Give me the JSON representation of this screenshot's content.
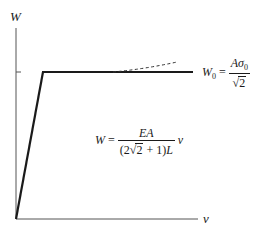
{
  "diagram": {
    "type": "load-displacement curve",
    "axes": {
      "y_label": "W",
      "x_label": "v"
    },
    "curve": {
      "segments": [
        {
          "name": "linear-elastic",
          "from": [
            16,
            219
          ],
          "to": [
            43,
            72
          ],
          "style": "solid-thick"
        },
        {
          "name": "plastic-plateau",
          "from": [
            43,
            72
          ],
          "to": [
            193,
            72
          ],
          "style": "solid-thick"
        },
        {
          "name": "hardening-trend",
          "from": [
            113,
            72
          ],
          "to": [
            177,
            62
          ],
          "style": "dashed"
        }
      ],
      "color": "#1a1a1a"
    },
    "plateau_label": {
      "lhs": "W",
      "lhs_sub": "0",
      "equals": "=",
      "numerator": "Aσ",
      "numerator_sub": "0",
      "denominator_sqrt": "√",
      "denominator_radicand": "2"
    },
    "slope_label": {
      "lhs": "W",
      "equals": "=",
      "numerator": "EA",
      "den_open": "(2",
      "den_sqrt": "√",
      "den_radicand": "2",
      "den_close": " + 1)",
      "den_L": "L",
      "variable": "v"
    }
  }
}
